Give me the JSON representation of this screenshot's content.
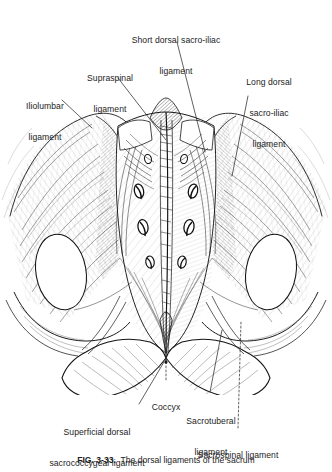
{
  "figure": {
    "title": "Dorsal ligaments of the sacrum",
    "illustration_name": "sacrum-dorsal-ligaments-engraving",
    "style": "pen-and-ink anatomical line engraving",
    "background_color": "#ffffff",
    "ink_color": "#1c1c1c",
    "view": "posterior (dorsal) view of sacrum, coccyx and iliac bones"
  },
  "labels": [
    {
      "id": "short-dorsal-sacro-iliac-ligament",
      "line1": "Short dorsal sacro-iliac",
      "line2": "ligament",
      "align": "center"
    },
    {
      "id": "supraspinal-ligament",
      "line1": "Supraspinal",
      "line2": "ligament",
      "align": "center"
    },
    {
      "id": "long-dorsal-sacro-iliac-ligament",
      "line1": "Long dorsal",
      "line2": "sacro-iliac",
      "line3": "ligament",
      "align": "center"
    },
    {
      "id": "iliolumbar-ligament",
      "line1": "Iliolumbar",
      "line2": "ligament",
      "align": "center"
    },
    {
      "id": "coccyx",
      "line1": "Coccyx",
      "align": "center"
    },
    {
      "id": "superficial-dorsal-sacrococcygeal-ligament",
      "line1": "Superficial dorsal",
      "line2": "sacrococcygeal ligament",
      "align": "center"
    },
    {
      "id": "sacrotuberal-ligament",
      "line1": "Sacrotuberal",
      "line2": "ligament",
      "align": "center"
    },
    {
      "id": "sacrospinal-ligament",
      "line1": "Sacrospinal ligament",
      "align": "center"
    }
  ],
  "caption": {
    "figure_number": "FIG. 3-33.",
    "text": "The dorsal ligaments of the sacrum",
    "clipped": true
  }
}
